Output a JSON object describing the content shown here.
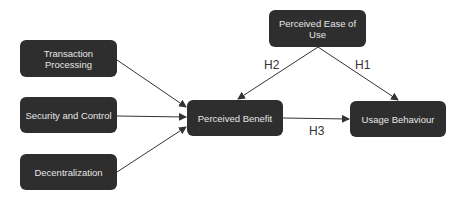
{
  "nodes": {
    "transaction_processing": "Transaction\nProcessing",
    "transaction_processing_l1": "Transaction",
    "transaction_processing_l2": "Processing",
    "security_control": "Security and Control",
    "decentralization": "Decentralization",
    "perceived_benefit": "Perceived Benefit",
    "usage_behaviour": "Usage Behaviour",
    "perceived_ease_of_use": "Perceived Ease of Use"
  },
  "edges": [
    {
      "from": "Transaction Processing",
      "to": "Perceived Benefit",
      "label": ""
    },
    {
      "from": "Security and Control",
      "to": "Perceived Benefit",
      "label": ""
    },
    {
      "from": "Decentralization",
      "to": "Perceived Benefit",
      "label": ""
    },
    {
      "from": "Perceived Ease of Use",
      "to": "Perceived Benefit",
      "label": "H2"
    },
    {
      "from": "Perceived Ease of Use",
      "to": "Usage Behaviour",
      "label": "H1"
    },
    {
      "from": "Perceived Benefit",
      "to": "Usage Behaviour",
      "label": "H3"
    }
  ],
  "labels": {
    "h1": "H1",
    "h2": "H2",
    "h3": "H3"
  },
  "colors": {
    "node_fill": "#2e2e2e",
    "node_text": "#e6e6e6",
    "edge": "#333333"
  }
}
